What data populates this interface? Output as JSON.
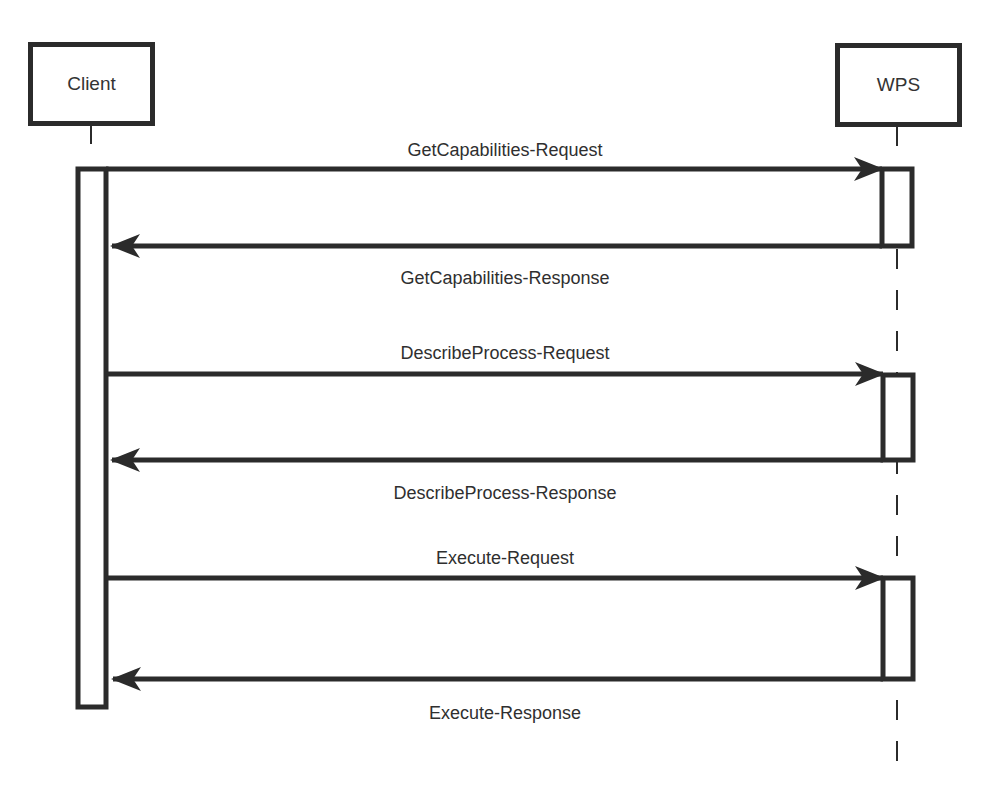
{
  "diagram": {
    "type": "sequence",
    "actors": [
      {
        "id": "client",
        "label": "Client"
      },
      {
        "id": "wps",
        "label": "WPS"
      }
    ],
    "messages": [
      {
        "from": "client",
        "to": "wps",
        "label": "GetCapabilities-Request",
        "kind": "request"
      },
      {
        "from": "wps",
        "to": "client",
        "label": "GetCapabilities-Response",
        "kind": "response"
      },
      {
        "from": "client",
        "to": "wps",
        "label": "DescribeProcess-Request",
        "kind": "request"
      },
      {
        "from": "wps",
        "to": "client",
        "label": "DescribeProcess-Response",
        "kind": "response"
      },
      {
        "from": "client",
        "to": "wps",
        "label": "Execute-Request",
        "kind": "request"
      },
      {
        "from": "wps",
        "to": "client",
        "label": "Execute-Response",
        "kind": "response"
      }
    ],
    "colors": {
      "stroke": "#2b2b2b",
      "background": "#ffffff",
      "text": "#2f2f2f"
    }
  }
}
